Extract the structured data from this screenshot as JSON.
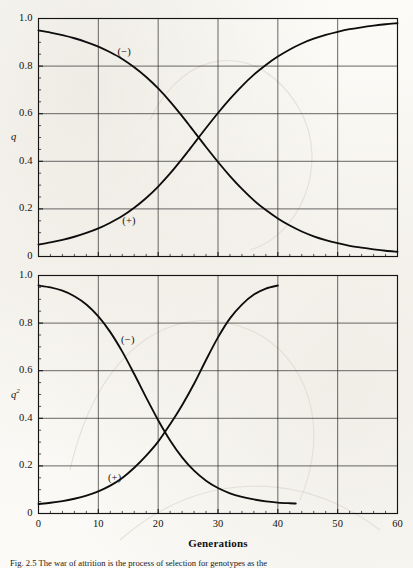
{
  "figure": {
    "caption": "Fig. 2.5  The war of attrition is the process of selection for genotypes as the",
    "caption_label": "Fig. 2.5"
  },
  "x_axis": {
    "title": "Generations",
    "ticks": [
      0,
      10,
      20,
      30,
      40,
      50,
      60
    ],
    "tick_labels": [
      "0",
      "10",
      "20",
      "30",
      "40",
      "50",
      "60"
    ],
    "min": 0,
    "max": 60,
    "minor_tick_step": 2
  },
  "panels": [
    {
      "name": "upper-panel",
      "y_title": "q",
      "y_title_sup": "",
      "y_ticks": [
        0,
        0.2,
        0.4,
        0.6,
        0.8,
        1.0
      ],
      "y_tick_labels": [
        "0",
        "0.2",
        "0.4",
        "0.6",
        "0.8",
        "1.0"
      ],
      "series_labels": [
        {
          "text": "(−)",
          "x": 13.2,
          "y": 0.855
        },
        {
          "text": "(+)",
          "x": 14.0,
          "y": 0.145
        }
      ]
    },
    {
      "name": "lower-panel",
      "y_title": "q",
      "y_title_sup": "2",
      "y_ticks": [
        0,
        0.2,
        0.4,
        0.6,
        0.8,
        1.0
      ],
      "y_tick_labels": [
        "0",
        "0.2",
        "0.4",
        "0.6",
        "0.8",
        "1.0"
      ],
      "series_labels": [
        {
          "text": "(−)",
          "x": 13.8,
          "y": 0.725
        },
        {
          "text": "(+)",
          "x": 11.6,
          "y": 0.145
        }
      ]
    }
  ],
  "colors": {
    "curve": "#0d0d0d",
    "grid": "#30302e",
    "axis": "#141414",
    "paper": "#fbfaf7"
  },
  "chart_data": [
    {
      "type": "line",
      "panel": "upper",
      "title": "",
      "xlabel": "Generations",
      "ylabel": "q",
      "xlim": [
        0,
        60
      ],
      "ylim": [
        0,
        1.0
      ],
      "grid": true,
      "legend": "inline-annotations",
      "x": [
        0,
        2,
        4,
        6,
        8,
        10,
        12,
        14,
        16,
        18,
        20,
        22,
        24,
        25,
        26,
        28,
        30,
        32,
        34,
        36,
        38,
        40,
        42,
        44,
        46,
        48,
        50,
        52,
        54,
        56,
        58,
        60
      ],
      "series": [
        {
          "name": "(−)",
          "values": [
            0.95,
            0.941,
            0.93,
            0.917,
            0.901,
            0.882,
            0.858,
            0.83,
            0.795,
            0.754,
            0.706,
            0.651,
            0.59,
            0.558,
            0.525,
            0.46,
            0.397,
            0.338,
            0.284,
            0.236,
            0.195,
            0.16,
            0.13,
            0.105,
            0.085,
            0.069,
            0.056,
            0.045,
            0.037,
            0.03,
            0.024,
            0.02
          ]
        },
        {
          "name": "(+)",
          "values": [
            0.05,
            0.059,
            0.07,
            0.083,
            0.099,
            0.118,
            0.142,
            0.17,
            0.205,
            0.246,
            0.294,
            0.349,
            0.41,
            0.442,
            0.475,
            0.54,
            0.603,
            0.662,
            0.716,
            0.764,
            0.805,
            0.84,
            0.87,
            0.895,
            0.915,
            0.931,
            0.944,
            0.955,
            0.963,
            0.97,
            0.976,
            0.98
          ]
        }
      ]
    },
    {
      "type": "line",
      "panel": "lower",
      "title": "",
      "xlabel": "Generations",
      "ylabel": "q²",
      "xlim": [
        0,
        60
      ],
      "ylim": [
        0,
        1.0
      ],
      "grid": true,
      "legend": "inline-annotations",
      "x": [
        0,
        2,
        4,
        6,
        8,
        10,
        12,
        14,
        16,
        18,
        20,
        22,
        24,
        26,
        28,
        30,
        32,
        34,
        36,
        38,
        40,
        42,
        43
      ],
      "series": [
        {
          "name": "(−)",
          "values": [
            0.958,
            0.95,
            0.936,
            0.913,
            0.878,
            0.828,
            0.762,
            0.68,
            0.586,
            0.487,
            0.392,
            0.307,
            0.236,
            0.18,
            0.138,
            0.107,
            0.085,
            0.07,
            0.059,
            0.051,
            0.046,
            0.043,
            0.042
          ]
        },
        {
          "name": "(+)",
          "values": [
            0.04,
            0.045,
            0.052,
            0.062,
            0.075,
            0.093,
            0.117,
            0.149,
            0.192,
            0.243,
            0.302,
            0.375,
            0.455,
            0.545,
            0.645,
            0.74,
            0.82,
            0.878,
            0.92,
            0.945,
            0.958,
            null,
            null
          ]
        }
      ]
    }
  ]
}
